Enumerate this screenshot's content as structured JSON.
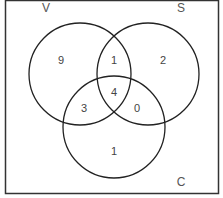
{
  "diagram": {
    "type": "venn",
    "sets": {
      "V": {
        "label": "V"
      },
      "S": {
        "label": "S"
      },
      "C": {
        "label": "C"
      }
    },
    "regions": {
      "V_only": "9",
      "S_only": "2",
      "C_only": "1",
      "V_S_only": "1",
      "V_C_only": "3",
      "S_C_only": "0",
      "V_S_C": "4"
    },
    "colors": {
      "stroke": "#222222",
      "text": "#555555",
      "border": "#333333"
    }
  }
}
